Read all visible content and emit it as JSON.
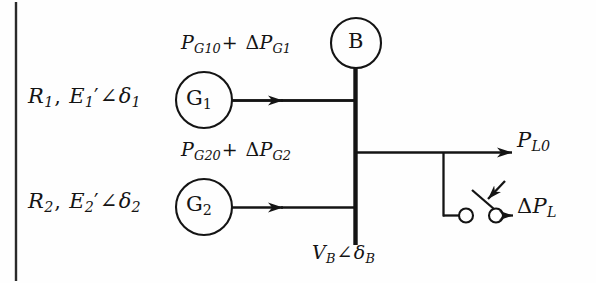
{
  "figure": {
    "background_color": "#fefefe",
    "stroke_color": "#141414",
    "width": 596,
    "height": 283
  },
  "generators": [
    {
      "id": "g1",
      "symbol": "G",
      "symbol_subscript": "1",
      "left_label": {
        "resistance": "R",
        "resistance_sub": "1",
        "comma": ",",
        "emf": "E",
        "emf_sub": "1",
        "prime": "′",
        "angle": "∠",
        "delta": "δ",
        "delta_sub": "1"
      },
      "power_label": {
        "p": "P",
        "p_sub": "G10",
        "plus": "+",
        "delta": "Δ",
        "dp": "P",
        "dp_sub": "G1"
      }
    },
    {
      "id": "g2",
      "symbol": "G",
      "symbol_subscript": "2",
      "left_label": {
        "resistance": "R",
        "resistance_sub": "2",
        "comma": ",",
        "emf": "E",
        "emf_sub": "2",
        "prime": "′",
        "angle": "∠",
        "delta": "δ",
        "delta_sub": "2"
      },
      "power_label": {
        "p": "P",
        "p_sub": "G20",
        "plus": "+",
        "delta": "Δ",
        "dp": "P",
        "dp_sub": "G2"
      }
    }
  ],
  "bus": {
    "symbol": "B",
    "voltage_label": {
      "v": "V",
      "v_sub": "B",
      "angle": "∠",
      "delta": "δ",
      "delta_sub": "B"
    }
  },
  "loads": [
    {
      "id": "base-load",
      "p": "P",
      "p_sub": "L0"
    },
    {
      "id": "step-load",
      "delta": "Δ",
      "p": "P",
      "p_sub": "L"
    }
  ],
  "switch": {
    "name": "load-step-switch",
    "state": "open"
  }
}
